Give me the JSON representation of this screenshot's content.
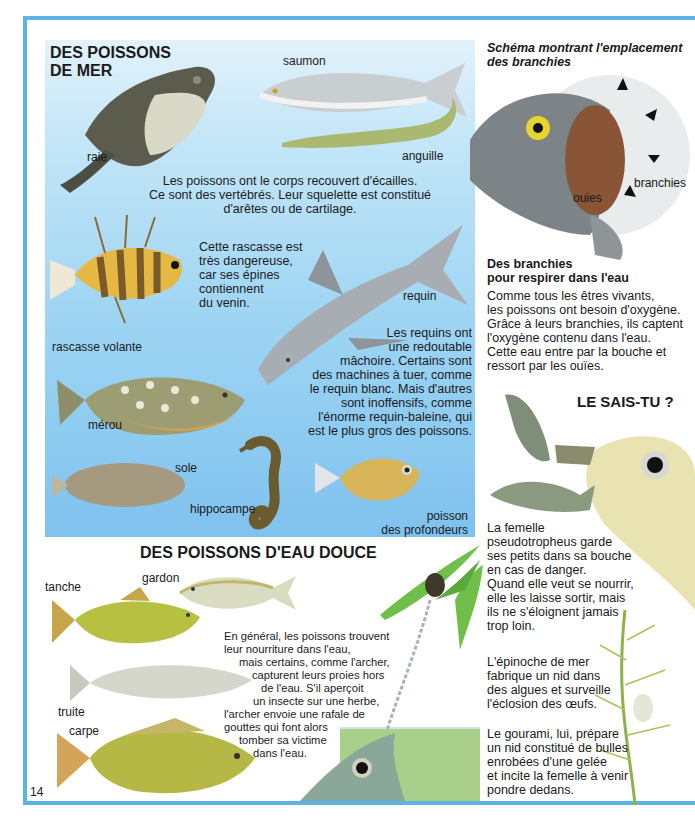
{
  "page": {
    "page_number": "14",
    "colors": {
      "frame": "#5bb3e6",
      "sea_top": "#e2f2fb",
      "sea_bottom": "#7fc2ee",
      "fresh_water": "#a9cf8b",
      "text": "#1a1a1a"
    }
  },
  "sea_fish": {
    "title_line1": "DES POISSONS",
    "title_line2": "DE MER",
    "intro_lines": [
      "Les poissons ont le corps recouvert d'écailles.",
      "Ce sont des vertébrés. Leur squelette est constitué",
      "d'arêtes ou de cartilage."
    ],
    "labels": {
      "raie": "raie",
      "saumon": "saumon",
      "anguille": "anguille",
      "rascasse": "rascasse volante",
      "requin": "requin",
      "merou": "mérou",
      "sole": "sole",
      "hippocampe": "hippocampe",
      "profondeurs_1": "poisson",
      "profondeurs_2": "des profondeurs"
    },
    "rascasse_lines": [
      "Cette rascasse est",
      "très dangereuse,",
      "car ses épines",
      "contiennent",
      "du venin."
    ],
    "shark_lines": [
      "Les requins ont",
      "une redoutable",
      "mâchoire. Certains sont",
      "des machines à tuer, comme",
      "le requin blanc. Mais d'autres",
      "sont inoffensifs, comme",
      "l'énorme requin-baleine, qui",
      "est le plus gros des poissons."
    ]
  },
  "fresh_fish": {
    "title": "DES POISSONS D'EAU DOUCE",
    "labels": {
      "tanche": "tanche",
      "gardon": "gardon",
      "truite": "truite",
      "carpe": "carpe"
    },
    "archer_lines": [
      "En général, les poissons trouvent",
      "leur nourriture dans l'eau,",
      "mais certains, comme l'archer,",
      "capturent leurs proies hors",
      "de l'eau. S'il aperçoit",
      "un insecte sur une herbe,",
      "l'archer envoie une rafale de",
      "gouttes qui font alors",
      "tomber sa victime",
      "dans l'eau."
    ]
  },
  "gills": {
    "title_line1": "Schéma montrant l'emplacement",
    "title_line2": "des branchies",
    "label_branchies": "branchies",
    "label_ouies": "ouies",
    "subtitle_line1": "Des branchies",
    "subtitle_line2": "pour respirer dans l'eau",
    "body_lines": [
      "Comme tous les êtres vivants,",
      "les poissons ont besoin d'oxygène.",
      "Grâce à leurs branchies, ils captent",
      "l'oxygène contenu dans l'eau.",
      "Cette eau entre par la bouche et",
      "ressort par les ouïes."
    ]
  },
  "did_you_know": {
    "title": "LE SAIS-TU ?",
    "pseudo_lines": [
      "La femelle",
      "pseudotropheus garde",
      "ses petits dans sa bouche",
      "en cas de danger.",
      "Quand elle veut se nourrir,",
      "elle les laisse sortir, mais",
      "ils ne s'éloignent jamais",
      "trop loin."
    ],
    "epinoche_lines": [
      "L'épinoche de mer",
      "fabrique un nid dans",
      "des algues et surveille",
      "l'éclosion des œufs."
    ],
    "gourami_lines": [
      "Le gourami, lui, prépare",
      "un nid constitué de bulles",
      "enrobées d'une gelée",
      "et incite la femelle à venir",
      "pondre dedans."
    ]
  }
}
